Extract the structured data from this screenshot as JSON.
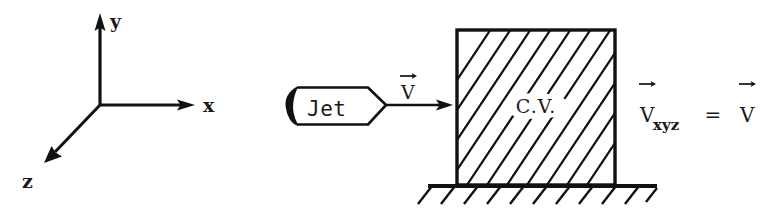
{
  "figure": {
    "background_color": "#ffffff",
    "ink_color": "#111111",
    "axes": {
      "name": "coordinate-axes",
      "origin_label": "",
      "x_label": "x",
      "y_label": "y",
      "z_label": "z"
    },
    "jet": {
      "label": "Jet",
      "velocity_label": "V",
      "velocity_has_vector_arrow": true
    },
    "control_volume": {
      "label": "C.V.",
      "hatching": "diagonal-45-up-right"
    },
    "ground": {
      "label": "",
      "hatching": "diagonal-ticks-below"
    },
    "equation": {
      "lhs_var": "V",
      "lhs_subscript": "xyz",
      "operator": "=",
      "rhs_var": "V",
      "lhs_has_vector_arrow": true,
      "rhs_has_vector_arrow": true,
      "full_text": "V_xyz = V"
    }
  }
}
